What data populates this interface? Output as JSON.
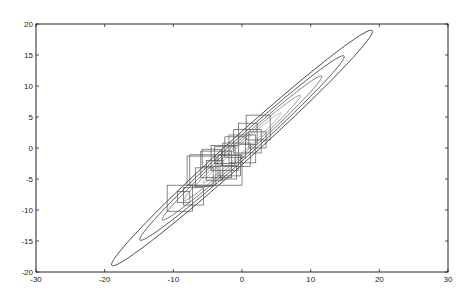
{
  "chart_data": {
    "type": "line",
    "title": "",
    "xlabel": "",
    "ylabel": "",
    "xlim": [
      -30,
      30
    ],
    "ylim": [
      -20,
      20
    ],
    "grid": false,
    "legend": null,
    "x_ticks": [
      -30,
      -20,
      -10,
      0,
      10,
      20,
      30
    ],
    "y_ticks": [
      -20,
      -15,
      -10,
      -5,
      0,
      5,
      10,
      15,
      20
    ],
    "x_tick_labels": [
      "-30",
      "-20",
      "-10",
      "0",
      "10",
      "20",
      "30"
    ],
    "y_tick_labels": [
      "-20",
      "-15",
      "-10",
      "-5",
      "0",
      "5",
      "10",
      "15",
      "20"
    ],
    "contours": [
      {
        "name": "contour-1",
        "center": [
          0,
          0
        ],
        "semi_major": 26.8,
        "semi_minor": 1.9,
        "angle_deg": 45,
        "color": "#333333"
      },
      {
        "name": "contour-2",
        "center": [
          0,
          0
        ],
        "semi_major": 21.0,
        "semi_minor": 1.5,
        "angle_deg": 45,
        "color": "#444444"
      },
      {
        "name": "contour-3",
        "center": [
          0,
          0
        ],
        "semi_major": 16.4,
        "semi_minor": 1.15,
        "angle_deg": 45,
        "color": "#666666"
      },
      {
        "name": "contour-4",
        "center": [
          0,
          0
        ],
        "semi_major": 12.0,
        "semi_minor": 0.85,
        "angle_deg": 45,
        "color": "#888888"
      },
      {
        "name": "contour-5",
        "center": [
          0,
          0
        ],
        "semi_major": 8.0,
        "semi_minor": 0.55,
        "angle_deg": 45,
        "color": "#aaaaaa"
      }
    ],
    "boxes": [
      {
        "x0": 0.6,
        "y0": 1.3,
        "x1": 4.1,
        "y1": 5.3
      },
      {
        "x0": -1.9,
        "y0": -2.4,
        "x1": 2.0,
        "y1": 2.1
      },
      {
        "x0": -2.5,
        "y0": -1.5,
        "x1": 0.5,
        "y1": 1.8
      },
      {
        "x0": -8.0,
        "y0": -6.0,
        "x1": -3.8,
        "y1": -1.3
      },
      {
        "x0": -7.6,
        "y0": -6.0,
        "x1": 0.0,
        "y1": -1.1
      },
      {
        "x0": -6.0,
        "y0": -4.8,
        "x1": -1.5,
        "y1": -0.5
      },
      {
        "x0": -4.5,
        "y0": -3.6,
        "x1": -0.5,
        "y1": 0.4
      },
      {
        "x0": -3.5,
        "y0": -4.5,
        "x1": -0.2,
        "y1": -1.2
      },
      {
        "x0": -5.2,
        "y0": -5.2,
        "x1": -2.8,
        "y1": -2.0
      },
      {
        "x0": -6.8,
        "y0": -6.2,
        "x1": -4.2,
        "y1": -3.2
      },
      {
        "x0": -2.8,
        "y0": -3.0,
        "x1": 1.2,
        "y1": 0.8
      },
      {
        "x0": -1.2,
        "y0": -0.8,
        "x1": 2.8,
        "y1": 3.0
      },
      {
        "x0": -10.9,
        "y0": -10.2,
        "x1": -7.2,
        "y1": -6.0
      },
      {
        "x0": -8.5,
        "y0": -9.2,
        "x1": -5.6,
        "y1": -6.4
      },
      {
        "x0": -9.4,
        "y0": -8.8,
        "x1": -7.6,
        "y1": -7.0
      },
      {
        "x0": -4.0,
        "y0": -2.5,
        "x1": -1.0,
        "y1": 0.2
      },
      {
        "x0": -0.5,
        "y0": 0.6,
        "x1": 2.2,
        "y1": 4.0
      },
      {
        "x0": 1.0,
        "y0": 0.0,
        "x1": 3.5,
        "y1": 2.6
      },
      {
        "x0": -3.2,
        "y0": -5.0,
        "x1": -0.8,
        "y1": -2.8
      },
      {
        "x0": -5.8,
        "y0": -3.0,
        "x1": -3.0,
        "y1": -0.2
      }
    ]
  }
}
